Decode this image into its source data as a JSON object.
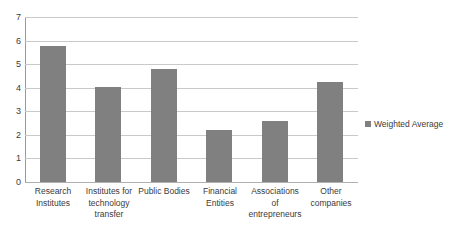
{
  "chart_data": {
    "type": "bar",
    "title": "",
    "xlabel": "",
    "ylabel": "",
    "ylim": [
      0,
      7
    ],
    "ytick_step": 1,
    "grid": true,
    "legend_position": "right",
    "categories": [
      "Research Institutes",
      "Institutes for technology transfer",
      "Public Bodies",
      "Financial Entities",
      "Associations of entrepreneurs",
      "Other companies"
    ],
    "category_lines": [
      [
        "Research",
        "Institutes"
      ],
      [
        "Institutes for",
        "technology",
        "transfer"
      ],
      [
        "Public Bodies"
      ],
      [
        "Financial",
        "Entities"
      ],
      [
        "Associations",
        "of",
        "entrepreneurs"
      ],
      [
        "Other",
        "companies"
      ]
    ],
    "ytick_labels": [
      "7",
      "6",
      "5",
      "4",
      "3",
      "2",
      "1",
      "0"
    ],
    "ytick_values": [
      7,
      6,
      5,
      4,
      3,
      2,
      1,
      0
    ],
    "series": [
      {
        "name": "Weighted Average",
        "values": [
          5.75,
          4.05,
          4.8,
          2.2,
          2.6,
          4.25
        ],
        "color": "#808080"
      }
    ]
  },
  "legend": {
    "entries": [
      {
        "label": "Weighted Average",
        "marker": "square-swatch",
        "color": "#808080"
      }
    ]
  },
  "colors": {
    "bar": "#808080",
    "gridline": "#c9c9c9",
    "axis": "#9a9a9a",
    "text": "#3b3b3b",
    "background": "#ffffff"
  }
}
